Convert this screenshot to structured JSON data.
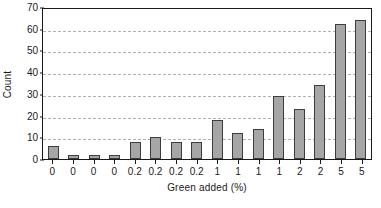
{
  "chart_data": {
    "type": "bar",
    "title": "",
    "subtitle": "",
    "xlabel": "Green added (%)",
    "ylabel": "Count",
    "categories": [
      "0",
      "0",
      "0",
      "0",
      "0.2",
      "0.2",
      "0.2",
      "0.2",
      "1",
      "1",
      "1",
      "1",
      "2",
      "2",
      "5",
      "5"
    ],
    "values": [
      6,
      2,
      2,
      2,
      8,
      10,
      8,
      8,
      18,
      12,
      14,
      29,
      23,
      34,
      62,
      64
    ],
    "series": [
      {
        "name": "Count",
        "values": [
          6,
          2,
          2,
          2,
          8,
          10,
          8,
          8,
          18,
          12,
          14,
          29,
          23,
          34,
          62,
          64
        ]
      }
    ],
    "ylim": [
      0,
      70
    ],
    "yticks": [
      0,
      10,
      20,
      30,
      40,
      50,
      60,
      70
    ],
    "ytick_labels": [
      "0",
      "10",
      "20",
      "30",
      "40",
      "50",
      "60",
      "70"
    ],
    "grid": true,
    "grid_axis": "y",
    "grid_style": "dashed",
    "legend": false,
    "legend_position": "none",
    "bar_fill_color": "#a6a6a6",
    "bar_edge_color": "#3d3d3d",
    "grid_color": "#b0b0b0",
    "axis_color": "#1a1a1a",
    "background_color": "#ffffff"
  }
}
